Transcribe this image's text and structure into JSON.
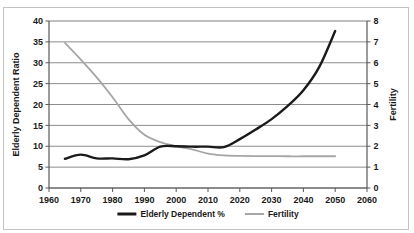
{
  "chart_data": {
    "type": "line",
    "title": "",
    "xlabel": "",
    "ylabel": "Elderly Dependent Ratio",
    "y2label": "Fertility",
    "xlim": [
      1960,
      2060
    ],
    "ylim": [
      0,
      40
    ],
    "y2lim": [
      0,
      8
    ],
    "xticks": [
      1960,
      1970,
      1980,
      1990,
      2000,
      2010,
      2020,
      2030,
      2040,
      2050,
      2060
    ],
    "yticks": [
      0,
      5,
      10,
      15,
      20,
      25,
      30,
      35,
      40
    ],
    "y2ticks": [
      0,
      1,
      2,
      3,
      4,
      5,
      6,
      7,
      8
    ],
    "grid": true,
    "grid_axis": "y",
    "legend_position": "bottom",
    "series": [
      {
        "name": "Elderly Dependent %",
        "axis": "left",
        "color": "#1a1a1a",
        "width": 2.4,
        "x": [
          1965,
          1970,
          1975,
          1980,
          1985,
          1990,
          1995,
          2000,
          2005,
          2010,
          2015,
          2020,
          2025,
          2030,
          2035,
          2040,
          2045,
          2050
        ],
        "values": [
          7.0,
          8.0,
          7.1,
          7.1,
          6.9,
          7.8,
          9.9,
          10.0,
          9.9,
          9.9,
          9.8,
          11.7,
          14.0,
          16.5,
          19.6,
          23.4,
          29.0,
          37.6
        ]
      },
      {
        "name": "Fertility",
        "axis": "right",
        "color": "#a6a6a6",
        "width": 1.8,
        "x": [
          1965,
          1970,
          1975,
          1980,
          1985,
          1990,
          1995,
          2000,
          2005,
          2010,
          2015,
          2020,
          2025,
          2030,
          2035,
          2040,
          2045,
          2050
        ],
        "values": [
          6.95,
          6.15,
          5.3,
          4.35,
          3.3,
          2.55,
          2.2,
          2.0,
          1.85,
          1.65,
          1.56,
          1.54,
          1.53,
          1.53,
          1.52,
          1.52,
          1.52,
          1.52
        ]
      }
    ]
  },
  "legend": {
    "items": [
      {
        "label": "Elderly Dependent %",
        "color": "#1a1a1a",
        "width": 3
      },
      {
        "label": "Fertility",
        "color": "#a6a6a6",
        "width": 2
      }
    ]
  },
  "colors": {
    "elderly_line": "#1a1a1a",
    "fertility_line": "#a6a6a6",
    "gridline": "#808080",
    "axis": "#595959",
    "frame": "#c3c3c3",
    "background": "#ffffff"
  }
}
